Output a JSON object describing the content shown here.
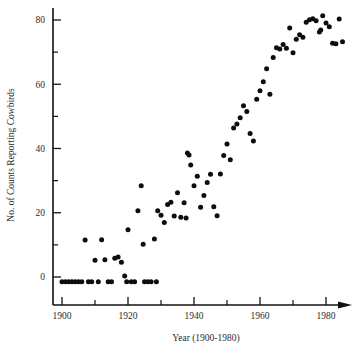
{
  "chart_data": {
    "type": "scatter",
    "title": "",
    "xlabel": "Year (1900-1980)",
    "ylabel": "No. of Counts Reporting Cowbirds",
    "xlim": [
      1898,
      1988
    ],
    "ylim": [
      -4,
      84
    ],
    "grid": false,
    "legend": null,
    "x_major_ticks": [
      1900,
      1920,
      1940,
      1960,
      1980
    ],
    "x_minor_ticks": [
      1910,
      1930,
      1950,
      1970
    ],
    "x_tick_labels": [
      "1900",
      "1920",
      "1940",
      "1960",
      "1980"
    ],
    "y_major_ticks": [
      0,
      20,
      40,
      60,
      80
    ],
    "y_minor_ticks": [
      10,
      30,
      50,
      70
    ],
    "y_tick_labels": [
      "0",
      "20",
      "40",
      "60",
      "80"
    ],
    "marker": "filled-circle",
    "marker_color": "#0d0d0d",
    "marker_size": 5,
    "axis_color": "#111111",
    "x_axis_has_arrow": true,
    "points": [
      [
        1900,
        -1.5
      ],
      [
        1901,
        -1.5
      ],
      [
        1902,
        -1.5
      ],
      [
        1903,
        -1.5
      ],
      [
        1904,
        -1.5
      ],
      [
        1905,
        -1.5
      ],
      [
        1906,
        -1.5
      ],
      [
        1907,
        11.5
      ],
      [
        1908,
        -1.5
      ],
      [
        1909,
        -1.5
      ],
      [
        1910,
        5.2
      ],
      [
        1911,
        -1.5
      ],
      [
        1912,
        11.6
      ],
      [
        1913,
        5.4
      ],
      [
        1914,
        -1.5
      ],
      [
        1915,
        -1.5
      ],
      [
        1916,
        5.8
      ],
      [
        1917,
        6.2
      ],
      [
        1918,
        4.6
      ],
      [
        1919,
        0.3
      ],
      [
        1919.6,
        -1.5
      ],
      [
        1920,
        14.7
      ],
      [
        1921,
        -1.5
      ],
      [
        1922,
        -1.5
      ],
      [
        1923,
        20.6
      ],
      [
        1924,
        28.4
      ],
      [
        1924.6,
        10.2
      ],
      [
        1925,
        -1.5
      ],
      [
        1926,
        -1.5
      ],
      [
        1927,
        -1.5
      ],
      [
        1928,
        11.8
      ],
      [
        1928.6,
        -1.5
      ],
      [
        1929,
        20.6
      ],
      [
        1930,
        19.2
      ],
      [
        1931,
        17.0
      ],
      [
        1932,
        22.6
      ],
      [
        1933,
        23.3
      ],
      [
        1934,
        19.0
      ],
      [
        1935,
        26.2
      ],
      [
        1936,
        18.6
      ],
      [
        1937,
        23.1
      ],
      [
        1937.6,
        18.4
      ],
      [
        1938,
        38.6
      ],
      [
        1938.5,
        38.0
      ],
      [
        1939,
        34.9
      ],
      [
        1940,
        28.4
      ],
      [
        1941,
        31.4
      ],
      [
        1942,
        21.7
      ],
      [
        1943,
        25.4
      ],
      [
        1944,
        29.4
      ],
      [
        1945,
        32.0
      ],
      [
        1946,
        21.9
      ],
      [
        1947,
        19.1
      ],
      [
        1948,
        32.1
      ],
      [
        1949,
        37.8
      ],
      [
        1950,
        41.4
      ],
      [
        1951,
        36.5
      ],
      [
        1952,
        46.4
      ],
      [
        1953,
        47.6
      ],
      [
        1954,
        49.6
      ],
      [
        1955,
        53.3
      ],
      [
        1956,
        51.5
      ],
      [
        1957,
        44.7
      ],
      [
        1958,
        42.3
      ],
      [
        1959,
        55.3
      ],
      [
        1960,
        58.0
      ],
      [
        1961,
        60.8
      ],
      [
        1962,
        64.8
      ],
      [
        1963,
        56.9
      ],
      [
        1964,
        68.3
      ],
      [
        1965,
        71.4
      ],
      [
        1966,
        71.0
      ],
      [
        1967,
        72.4
      ],
      [
        1968,
        71.2
      ],
      [
        1969,
        77.5
      ],
      [
        1970,
        69.8
      ],
      [
        1971,
        74.0
      ],
      [
        1972,
        75.4
      ],
      [
        1973,
        74.6
      ],
      [
        1974,
        79.3
      ],
      [
        1975,
        80.1
      ],
      [
        1976,
        80.4
      ],
      [
        1977,
        79.8
      ],
      [
        1978,
        76.3
      ],
      [
        1978.4,
        76.9
      ],
      [
        1979,
        81.3
      ],
      [
        1980,
        79.1
      ],
      [
        1981,
        77.9
      ],
      [
        1982,
        72.8
      ],
      [
        1983,
        72.6
      ],
      [
        1984,
        80.3
      ],
      [
        1985,
        73.2
      ]
    ]
  }
}
